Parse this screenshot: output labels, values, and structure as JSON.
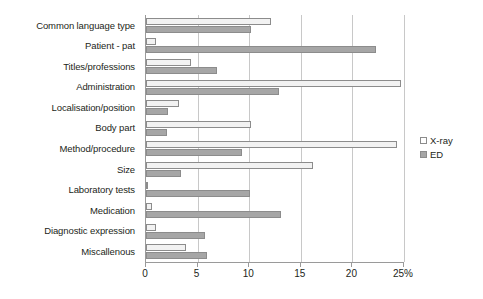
{
  "chart_data": {
    "type": "bar",
    "orientation": "horizontal",
    "title": "",
    "xlabel": "",
    "ylabel": "",
    "grid": true,
    "legend_position": "right",
    "xlim": [
      0,
      25
    ],
    "xticks": [
      0,
      5,
      10,
      15,
      20,
      25
    ],
    "xtick_labels": [
      "0",
      "5",
      "10",
      "15",
      "20",
      "25%"
    ],
    "categories": [
      "Common language type",
      "Patient - pat",
      "Titles/professions",
      "Administration",
      "Localisation/position",
      "Body part",
      "Method/procedure",
      "Size",
      "Laboratory tests",
      "Medication",
      "Diagnostic expression",
      "Miscallenous"
    ],
    "series": [
      {
        "name": "X-ray",
        "color": "#f2f2f2",
        "values": [
          12.1,
          1.0,
          4.4,
          24.7,
          3.2,
          10.2,
          24.3,
          16.2,
          0.1,
          0.6,
          1.0,
          3.9
        ]
      },
      {
        "name": "ED",
        "color": "#a6a6a6",
        "values": [
          10.2,
          22.3,
          6.9,
          12.9,
          2.1,
          2.0,
          9.3,
          3.4,
          10.1,
          13.1,
          5.7,
          5.9
        ]
      }
    ]
  },
  "legend": {
    "items": [
      {
        "label": "X-ray",
        "swatch": "legend-swatch-xray"
      },
      {
        "label": "ED",
        "swatch": "legend-swatch-ed"
      }
    ]
  }
}
